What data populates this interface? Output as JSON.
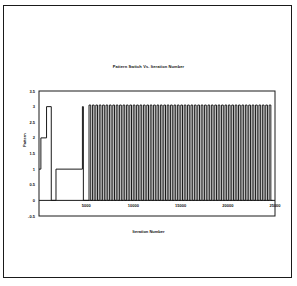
{
  "chart_data": {
    "type": "line",
    "title": "Pattern Switch Vs. Iteration Number",
    "xlabel": "Iteration Number",
    "ylabel": "Pattern",
    "xlim": [
      0,
      25000
    ],
    "ylim": [
      -0.5,
      3.5
    ],
    "xticks": [
      5000,
      10000,
      15000,
      20000,
      25000
    ],
    "yticks": [
      -0.5,
      0,
      0.5,
      1,
      1.5,
      2,
      2.5,
      3,
      3.5
    ],
    "grid": false,
    "legend": null,
    "series": [
      {
        "name": "Pattern",
        "step": true,
        "points": [
          [
            0,
            1
          ],
          [
            200,
            1
          ],
          [
            200,
            2
          ],
          [
            800,
            2
          ],
          [
            800,
            3
          ],
          [
            1300,
            3
          ],
          [
            1300,
            0
          ],
          [
            1800,
            0
          ],
          [
            1800,
            1
          ],
          [
            4600,
            1
          ],
          [
            4600,
            3
          ],
          [
            4700,
            3
          ],
          [
            4700,
            0
          ],
          [
            5300,
            0
          ]
        ],
        "oscillation": {
          "start": 5300,
          "end": 25000,
          "low": 0,
          "high": 3.05,
          "period": 360,
          "approx_cycles": 55
        }
      }
    ]
  },
  "chart": {
    "title": "Pattern Switch Vs. Iteration Number",
    "xlabel": "Iteration Number",
    "ylabel": "Pattern",
    "ytick_labels": [
      "3.5",
      "3",
      "2.5",
      "2",
      "1.5",
      "1",
      "0.5",
      "0",
      "-0.5"
    ],
    "xtick_labels": [
      "5000",
      "10000",
      "15000",
      "20000",
      "25000"
    ],
    "line_color": "#1a1a1a",
    "frame_color": "#1a1a1a"
  }
}
